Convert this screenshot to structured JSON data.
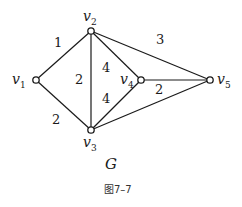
{
  "graph": {
    "name": "G",
    "caption": "图7–7",
    "vertices": [
      {
        "id": "v1",
        "letter": "v",
        "sub": "1",
        "x": 36,
        "y": 80
      },
      {
        "id": "v2",
        "letter": "v",
        "sub": "2",
        "x": 91,
        "y": 31
      },
      {
        "id": "v3",
        "letter": "v",
        "sub": "3",
        "x": 91,
        "y": 130
      },
      {
        "id": "v4",
        "letter": "v",
        "sub": "4",
        "x": 141,
        "y": 80
      },
      {
        "id": "v5",
        "letter": "v",
        "sub": "5",
        "x": 210,
        "y": 80
      }
    ],
    "edges": [
      {
        "from": "v1",
        "to": "v2",
        "weight": "1"
      },
      {
        "from": "v1",
        "to": "v3",
        "weight": "2"
      },
      {
        "from": "v2",
        "to": "v3",
        "weight": "2"
      },
      {
        "from": "v2",
        "to": "v4",
        "weight": "4"
      },
      {
        "from": "v3",
        "to": "v4",
        "weight": "4"
      },
      {
        "from": "v2",
        "to": "v5",
        "weight": "3"
      },
      {
        "from": "v4",
        "to": "v5",
        "weight": "2"
      },
      {
        "from": "v3",
        "to": "v5",
        "weight": ""
      }
    ]
  }
}
